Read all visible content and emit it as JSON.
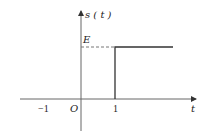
{
  "diagram": {
    "type": "step-function-plot",
    "ylabel": "s ( t )",
    "xlabel": "t",
    "level_label": "E",
    "origin_label": "O",
    "x_ticks": [
      {
        "label": "−1",
        "value": -1
      },
      {
        "label": "1",
        "value": 1
      }
    ],
    "function": {
      "description": "s(t) = E for t >= 1, 0 otherwise",
      "step_at": 1,
      "level": "E"
    },
    "colors": {
      "axis": "#555555",
      "signal": "#333333",
      "dashed": "#777777"
    }
  }
}
